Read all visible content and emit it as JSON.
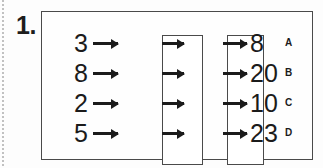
{
  "page": {
    "item_number": "1.",
    "background_color": "#fdfdfd",
    "ink_color": "#1b1b1b",
    "frame_color": "#4a4a4a"
  },
  "diagram": {
    "type": "function-machine",
    "machine_count": 2,
    "machines": [
      {
        "id": "machine-1",
        "label": ""
      },
      {
        "id": "machine-2",
        "label": ""
      }
    ],
    "rows": [
      {
        "input": "3",
        "output": "8",
        "option": "A"
      },
      {
        "input": "8",
        "output": "20",
        "option": "B"
      },
      {
        "input": "2",
        "output": "10",
        "option": "C"
      },
      {
        "input": "5",
        "output": "23",
        "option": "D"
      }
    ],
    "arrows": {
      "input_arrow": "arrow-right-icon",
      "middle_arrow": "arrow-right-icon",
      "output_arrow": "arrow-right-icon"
    }
  }
}
